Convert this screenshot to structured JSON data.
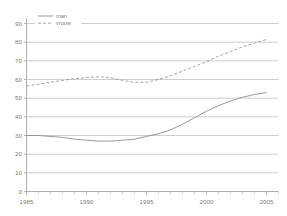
{
  "chart_data": {
    "type": "line",
    "title": "",
    "subtitle": "",
    "xlabel": "",
    "ylabel": "",
    "xlim": [
      1985,
      2006
    ],
    "ylim": [
      0,
      90
    ],
    "grid": true,
    "legend_position": "top-left",
    "yticks": [
      0,
      10,
      20,
      30,
      40,
      50,
      60,
      70,
      80,
      90
    ],
    "ytick_labels": [
      "0",
      "10",
      "20",
      "30",
      "40",
      "50",
      "60",
      "70",
      "80",
      "90"
    ],
    "xticks": [
      1985,
      1990,
      1995,
      2000,
      2005
    ],
    "xtick_labels": [
      "1985",
      "1990",
      "1995",
      "2000",
      "2005"
    ],
    "x_minor_ticks": [
      1986,
      1987,
      1988,
      1989,
      1991,
      1992,
      1993,
      1994,
      1996,
      1997,
      1998,
      1999,
      2001,
      2002,
      2003,
      2004,
      2006
    ],
    "x": [
      1985,
      1986,
      1987,
      1988,
      1989,
      1990,
      1991,
      1992,
      1993,
      1994,
      1995,
      1996,
      1997,
      1998,
      1999,
      2000,
      2001,
      2002,
      2003,
      2004,
      2005
    ],
    "series": [
      {
        "name": "man",
        "style": "solid",
        "color": "#8d8d8d",
        "values": [
          30,
          30,
          29.5,
          29,
          28,
          27.5,
          27,
          27,
          27.5,
          28,
          29.5,
          31,
          33,
          36,
          39.5,
          43,
          46,
          48.5,
          50.5,
          52,
          53
        ]
      },
      {
        "name": "vrouw",
        "style": "dashed",
        "color": "#9b9b9b",
        "values": [
          56.5,
          57.5,
          58.5,
          59.5,
          60.5,
          61,
          61.5,
          61,
          59.5,
          58.5,
          58.5,
          60,
          62,
          64.5,
          67,
          69.5,
          72.5,
          75,
          77.5,
          79.5,
          81.5
        ]
      }
    ]
  },
  "legend": {
    "entries": [
      {
        "label": "man"
      },
      {
        "label": "vrouw"
      }
    ]
  }
}
